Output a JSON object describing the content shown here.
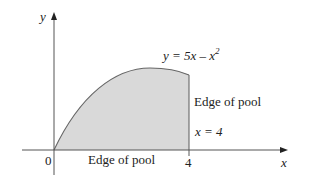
{
  "figure": {
    "axes": {
      "x_label": "x",
      "y_label": "y",
      "origin_label": "0",
      "x_tick_label": "4"
    },
    "curve": {
      "equation_prefix": "y = 5x – x",
      "equation_exponent": "2"
    },
    "labels": {
      "bottom_edge": "Edge of pool",
      "right_edge": "Edge of pool",
      "right_line": "x = 4"
    },
    "colors": {
      "fill": "#d9d9d9",
      "curve": "#666666",
      "axis": "#555555"
    }
  }
}
